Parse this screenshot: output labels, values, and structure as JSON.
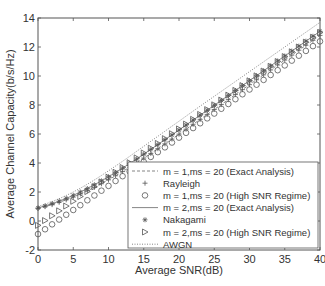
{
  "chart_data": {
    "type": "line",
    "title": "",
    "xlabel": "Average SNR(dB)",
    "ylabel": "Average Channel Capacity(b/s/Hz)",
    "xlim": [
      0,
      40
    ],
    "ylim": [
      -2,
      14
    ],
    "xticks": [
      0,
      5,
      10,
      15,
      20,
      25,
      30,
      35,
      40
    ],
    "yticks": [
      -2,
      0,
      2,
      4,
      6,
      8,
      10,
      12,
      14
    ],
    "grid": false,
    "legend_position": "lower right",
    "x": [
      0,
      1,
      2,
      3,
      4,
      5,
      6,
      7,
      8,
      9,
      10,
      11,
      12,
      13,
      14,
      15,
      16,
      17,
      18,
      19,
      20,
      21,
      22,
      23,
      24,
      25,
      26,
      27,
      28,
      29,
      30,
      31,
      32,
      33,
      34,
      35,
      36,
      37,
      38,
      39,
      40
    ],
    "series": [
      {
        "name": "m = 1,ms = 20 (Exact Analysis)",
        "style": "dashed",
        "marker": "none",
        "values": [
          0.86,
          0.99,
          1.13,
          1.29,
          1.46,
          1.65,
          1.86,
          2.08,
          2.32,
          2.57,
          2.84,
          3.12,
          3.41,
          3.71,
          4.02,
          4.34,
          4.66,
          4.99,
          5.32,
          5.65,
          5.99,
          6.33,
          6.67,
          7.01,
          7.35,
          7.69,
          8.03,
          8.37,
          8.72,
          9.06,
          9.4,
          9.74,
          10.08,
          10.42,
          10.76,
          11.1,
          11.44,
          11.78,
          12.12,
          12.46,
          12.8
        ]
      },
      {
        "name": "Rayleigh",
        "style": "none",
        "marker": "+",
        "values": [
          0.86,
          0.99,
          1.13,
          1.29,
          1.46,
          1.65,
          1.86,
          2.08,
          2.32,
          2.57,
          2.84,
          3.12,
          3.41,
          3.71,
          4.02,
          4.34,
          4.66,
          4.99,
          5.32,
          5.65,
          5.99,
          6.33,
          6.67,
          7.01,
          7.35,
          7.69,
          8.03,
          8.37,
          8.72,
          9.06,
          9.4,
          9.74,
          10.08,
          10.42,
          10.76,
          11.1,
          11.44,
          11.78,
          12.12,
          12.46,
          12.8
        ]
      },
      {
        "name": "m = 1,ms = 20 (High SNR Regime)",
        "style": "none",
        "marker": "o",
        "values": [
          -0.9,
          -0.57,
          -0.23,
          0.1,
          0.43,
          0.76,
          1.09,
          1.43,
          1.76,
          2.09,
          2.42,
          2.76,
          3.09,
          3.42,
          3.75,
          4.08,
          4.42,
          4.75,
          5.08,
          5.41,
          5.75,
          6.08,
          6.41,
          6.74,
          7.08,
          7.41,
          7.74,
          8.07,
          8.4,
          8.74,
          9.07,
          9.4,
          9.73,
          10.07,
          10.4,
          10.73,
          11.06,
          11.4,
          11.73,
          12.06,
          12.39
        ]
      },
      {
        "name": "m = 2,ms = 20 (Exact Analysis)",
        "style": "solid",
        "marker": "none",
        "values": [
          0.9,
          1.04,
          1.2,
          1.37,
          1.56,
          1.77,
          2.0,
          2.24,
          2.5,
          2.77,
          3.05,
          3.35,
          3.65,
          3.96,
          4.28,
          4.61,
          4.94,
          5.27,
          5.61,
          5.94,
          6.28,
          6.62,
          6.96,
          7.3,
          7.64,
          7.98,
          8.32,
          8.66,
          9.0,
          9.34,
          9.68,
          10.02,
          10.36,
          10.7,
          11.04,
          11.38,
          11.72,
          12.06,
          12.4,
          12.74,
          13.08
        ]
      },
      {
        "name": "Nakagami",
        "style": "none",
        "marker": "*",
        "values": [
          0.9,
          1.04,
          1.2,
          1.37,
          1.56,
          1.77,
          2.0,
          2.24,
          2.5,
          2.77,
          3.05,
          3.35,
          3.65,
          3.96,
          4.28,
          4.61,
          4.94,
          5.27,
          5.61,
          5.94,
          6.28,
          6.62,
          6.96,
          7.3,
          7.64,
          7.98,
          8.32,
          8.66,
          9.0,
          9.34,
          9.68,
          10.02,
          10.36,
          10.7,
          11.04,
          11.38,
          11.72,
          12.06,
          12.4,
          12.74,
          13.08
        ]
      },
      {
        "name": "m = 2,ms = 20 (High SNR Regime)",
        "style": "none",
        "marker": "triangle-right",
        "values": [
          -0.3,
          0.03,
          0.36,
          0.7,
          1.03,
          1.36,
          1.69,
          2.03,
          2.36,
          2.69,
          3.02,
          3.36,
          3.69,
          4.02,
          4.35,
          4.69,
          5.02,
          5.35,
          5.68,
          6.02,
          6.35,
          6.68,
          7.01,
          7.35,
          7.68,
          8.01,
          8.34,
          8.68,
          9.01,
          9.34,
          9.67,
          10.01,
          10.34,
          10.67,
          11.0,
          11.34,
          11.67,
          12.0,
          12.33,
          12.67,
          13.0
        ]
      },
      {
        "name": "AWGN",
        "style": "dotted",
        "marker": "none",
        "values": [
          1.0,
          1.16,
          1.34,
          1.54,
          1.76,
          2.0,
          2.26,
          2.54,
          2.83,
          3.14,
          3.46,
          3.79,
          4.12,
          4.46,
          4.81,
          5.15,
          5.5,
          5.84,
          6.19,
          6.54,
          6.88,
          7.23,
          7.58,
          7.92,
          8.26,
          8.6,
          8.94,
          9.28,
          9.62,
          9.96,
          10.3,
          10.64,
          10.98,
          11.32,
          11.66,
          12.0,
          12.34,
          12.68,
          13.02,
          13.36,
          13.7
        ]
      }
    ]
  }
}
